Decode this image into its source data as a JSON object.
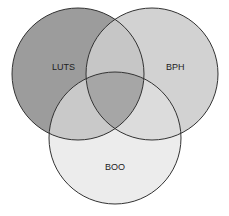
{
  "diagram": {
    "type": "venn",
    "sets": [
      {
        "id": "luts",
        "label": "LUTS",
        "fill": "#9a9a9a"
      },
      {
        "id": "bph",
        "label": "BPH",
        "fill": "#d0d0d0"
      },
      {
        "id": "boo",
        "label": "BOO",
        "fill": "#ececec"
      }
    ],
    "stroke": "#333333"
  }
}
